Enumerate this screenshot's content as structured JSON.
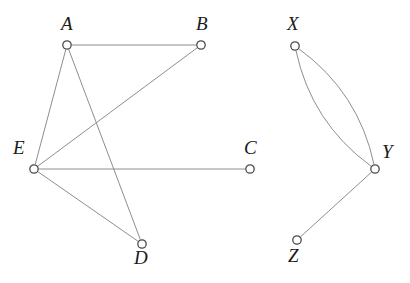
{
  "figure": {
    "width": 410,
    "height": 283,
    "background_color": "#ffffff",
    "edge_color": "#8e8e8e",
    "node_stroke_color": "#4a4a4a",
    "node_fill_color": "#ffffff",
    "label_color": "#1a1a1a"
  },
  "chart_data": {
    "type": "diagram",
    "diagram_kind": "undirected-graph",
    "components": 2,
    "nodes": [
      {
        "id": "A",
        "label": "A",
        "x": 67,
        "y": 45,
        "label_x": 61,
        "label_y": 14,
        "component": 1
      },
      {
        "id": "B",
        "label": "B",
        "x": 201,
        "y": 45,
        "label_x": 196,
        "label_y": 14,
        "component": 1
      },
      {
        "id": "C",
        "label": "C",
        "x": 250,
        "y": 169,
        "label_x": 244,
        "label_y": 138,
        "component": 1
      },
      {
        "id": "D",
        "label": "D",
        "x": 142,
        "y": 244,
        "label_x": 134,
        "label_y": 248,
        "component": 1
      },
      {
        "id": "E",
        "label": "E",
        "x": 34,
        "y": 169,
        "label_x": 13,
        "label_y": 138,
        "component": 1
      },
      {
        "id": "X",
        "label": "X",
        "x": 295,
        "y": 46,
        "label_x": 287,
        "label_y": 14,
        "component": 2
      },
      {
        "id": "Y",
        "label": "Y",
        "x": 375,
        "y": 169,
        "label_x": 382,
        "label_y": 142,
        "component": 2
      },
      {
        "id": "Z",
        "label": "Z",
        "x": 297,
        "y": 240,
        "label_x": 288,
        "label_y": 246,
        "component": 2
      }
    ],
    "edges": [
      {
        "source": "A",
        "target": "B",
        "style": "straight"
      },
      {
        "source": "A",
        "target": "E",
        "style": "straight"
      },
      {
        "source": "A",
        "target": "D",
        "style": "straight"
      },
      {
        "source": "E",
        "target": "B",
        "style": "straight"
      },
      {
        "source": "E",
        "target": "C",
        "style": "straight"
      },
      {
        "source": "E",
        "target": "D",
        "style": "straight"
      },
      {
        "source": "X",
        "target": "Y",
        "style": "curved-left",
        "curvature": -28
      },
      {
        "source": "X",
        "target": "Y",
        "style": "curved-right",
        "curvature": 28
      },
      {
        "source": "Y",
        "target": "Z",
        "style": "straight"
      }
    ],
    "node_radius": 4.2,
    "multi_edges": [
      {
        "between": [
          "X",
          "Y"
        ],
        "count": 2
      }
    ]
  }
}
